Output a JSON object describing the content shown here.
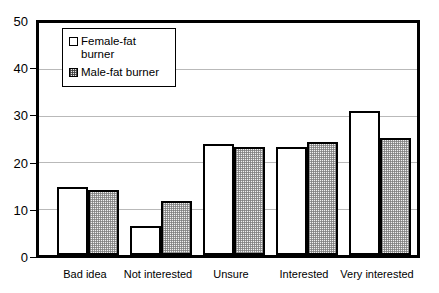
{
  "chart_data": {
    "type": "bar",
    "title": "",
    "subtitle": "",
    "xlabel": "",
    "ylabel": "",
    "ylim": [
      0,
      50
    ],
    "yticks": [
      0,
      10,
      20,
      30,
      40,
      50
    ],
    "ytick_labels": [
      "0",
      "10",
      "20",
      "30",
      "40",
      "50"
    ],
    "grid": true,
    "grid_axis": "y",
    "legend_position": "upper-left-inside",
    "categories": [
      "Bad idea",
      "Not interested",
      "Unsure",
      "Interested",
      "Very interested"
    ],
    "series": [
      {
        "name": "Female-fat burner",
        "legend_label_lines": [
          "Female-fat",
          "burner"
        ],
        "swatch": "white",
        "color": "#ffffff",
        "values": [
          14.6,
          6.2,
          24.0,
          23.2,
          31.1
        ]
      },
      {
        "name": "Male-fat burner",
        "legend_label_lines": [
          "Male-fat burner"
        ],
        "swatch": "stipple",
        "color": "#e9e9e9",
        "values": [
          14.0,
          11.6,
          23.3,
          24.3,
          25.3
        ]
      }
    ]
  },
  "legend": {
    "items": [
      {
        "label": "Female-fat burner",
        "line1": "Female-fat",
        "line2": "burner"
      },
      {
        "label": "Male-fat burner",
        "line1": "Male-fat burner",
        "line2": ""
      }
    ]
  },
  "axes": {
    "y": {
      "ticks": [
        "50",
        "40",
        "30",
        "20",
        "10",
        "0"
      ]
    },
    "x": {
      "labels": [
        "Bad idea",
        "Not interested",
        "Unsure",
        "Interested",
        "Very interested"
      ]
    }
  }
}
